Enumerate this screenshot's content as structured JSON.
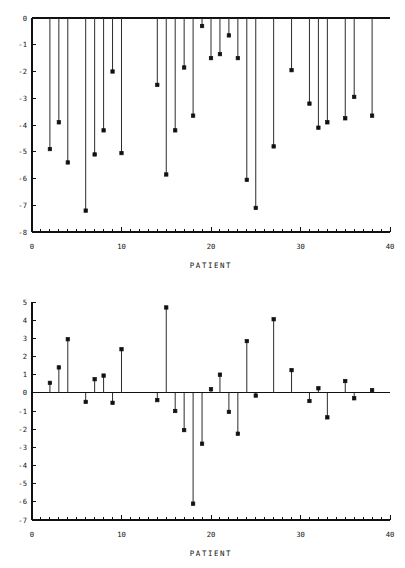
{
  "figure": {
    "background": "#ffffff",
    "ink_color": "#111111",
    "stem_color": "#2b2b2b"
  },
  "chart_data": [
    {
      "id": "top",
      "type": "scatter",
      "subtype": "stem",
      "title": "",
      "xlabel": "PATIENT",
      "ylabel": "",
      "xlim": [
        0,
        40
      ],
      "ylim": [
        -8,
        0
      ],
      "xticks": [
        0,
        10,
        20,
        30,
        40
      ],
      "xticklabels": [
        "0",
        "10",
        "20",
        "30",
        "40"
      ],
      "xminor_step": 1,
      "yticks": [
        0,
        -1,
        -2,
        -3,
        -4,
        -5,
        -6,
        -7,
        -8
      ],
      "yticklabels": [
        "0",
        "-1",
        "-2",
        "-3",
        "-4",
        "-5",
        "-6",
        "-7",
        "-8"
      ],
      "grid": false,
      "legend": null,
      "baseline": 0,
      "marker": "filled-square",
      "x": [
        2,
        3,
        4,
        6,
        7,
        8,
        9,
        10,
        14,
        15,
        16,
        17,
        18,
        19,
        20,
        21,
        22,
        23,
        24,
        25,
        27,
        29,
        31,
        32,
        33,
        35,
        36,
        38
      ],
      "y": [
        -4.9,
        -3.9,
        -5.4,
        -7.2,
        -5.1,
        -4.2,
        -2.0,
        -5.05,
        -2.5,
        -5.85,
        -4.2,
        -1.85,
        -3.65,
        -0.3,
        -1.5,
        -1.35,
        -0.65,
        -1.5,
        -6.05,
        -7.1,
        -4.8,
        -1.95,
        -3.2,
        -4.1,
        -3.9,
        -3.75,
        -2.95,
        -3.65
      ]
    },
    {
      "id": "bottom",
      "type": "scatter",
      "subtype": "stem",
      "title": "",
      "xlabel": "PATIENT",
      "ylabel": "",
      "xlim": [
        0,
        40
      ],
      "ylim": [
        -7,
        5
      ],
      "xticks": [
        0,
        10,
        20,
        30,
        40
      ],
      "xticklabels": [
        "0",
        "10",
        "20",
        "30",
        "40"
      ],
      "xminor_step": 1,
      "yticks": [
        5,
        4,
        3,
        2,
        1,
        0,
        -1,
        -2,
        -3,
        -4,
        -5,
        -6,
        -7
      ],
      "yticklabels": [
        "5",
        "4",
        "3",
        "2",
        "1",
        "0",
        "-1",
        "-2",
        "-3",
        "-4",
        "-5",
        "-6",
        "-7"
      ],
      "grid": false,
      "legend": null,
      "baseline": 0,
      "marker": "filled-square",
      "x": [
        2,
        3,
        4,
        6,
        7,
        8,
        9,
        10,
        14,
        15,
        16,
        17,
        18,
        19,
        20,
        21,
        22,
        23,
        24,
        25,
        27,
        29,
        31,
        32,
        33,
        35,
        36,
        38
      ],
      "y": [
        0.55,
        1.4,
        2.95,
        -0.5,
        0.75,
        0.95,
        -0.55,
        2.4,
        -0.4,
        4.7,
        -1.0,
        -2.05,
        -6.1,
        -2.8,
        0.2,
        1.0,
        -1.05,
        -2.25,
        2.85,
        -0.15,
        4.05,
        1.25,
        -0.45,
        0.25,
        -1.35,
        0.65,
        -0.3,
        0.15
      ]
    }
  ]
}
